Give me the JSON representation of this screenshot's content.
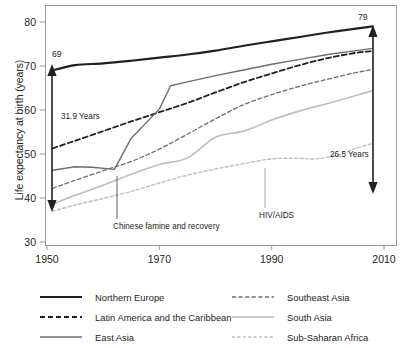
{
  "chart_data": {
    "type": "line",
    "title": "",
    "xlabel": "",
    "ylabel": "Life expectancy at birth (years)",
    "xlim": [
      1950,
      2012
    ],
    "ylim": [
      30,
      82
    ],
    "xticks": [
      1950,
      1970,
      1990,
      2010
    ],
    "yticks": [
      30,
      40,
      50,
      60,
      70,
      80
    ],
    "grid": false,
    "legend_position": "bottom",
    "series": [
      {
        "name": "Northern Europe",
        "style": "solid-thick-black",
        "color": "#231f20",
        "points": [
          [
            1951,
            69.0
          ],
          [
            1955,
            70.2
          ],
          [
            1960,
            70.6
          ],
          [
            1965,
            71.2
          ],
          [
            1970,
            71.9
          ],
          [
            1975,
            72.6
          ],
          [
            1980,
            73.5
          ],
          [
            1985,
            74.6
          ],
          [
            1990,
            75.6
          ],
          [
            1995,
            76.6
          ],
          [
            2000,
            77.6
          ],
          [
            2005,
            78.5
          ],
          [
            2008,
            79.0
          ]
        ]
      },
      {
        "name": "Latin America and the Caribbean",
        "style": "dashed-black",
        "color": "#231f20",
        "points": [
          [
            1951,
            51.3
          ],
          [
            1955,
            53.0
          ],
          [
            1960,
            55.2
          ],
          [
            1965,
            57.4
          ],
          [
            1970,
            59.5
          ],
          [
            1975,
            61.6
          ],
          [
            1980,
            64.0
          ],
          [
            1985,
            66.3
          ],
          [
            1990,
            68.3
          ],
          [
            1995,
            70.2
          ],
          [
            2000,
            71.8
          ],
          [
            2005,
            73.0
          ],
          [
            2008,
            73.4
          ]
        ]
      },
      {
        "name": "East Asia",
        "style": "solid-gray",
        "color": "#6d6e71",
        "points": [
          [
            1951,
            46.3
          ],
          [
            1955,
            47.1
          ],
          [
            1958,
            47.0
          ],
          [
            1962,
            46.5
          ],
          [
            1965,
            53.6
          ],
          [
            1970,
            60.2
          ],
          [
            1972,
            65.5
          ],
          [
            1975,
            66.4
          ],
          [
            1980,
            67.8
          ],
          [
            1985,
            69.1
          ],
          [
            1990,
            70.4
          ],
          [
            1995,
            71.5
          ],
          [
            2000,
            72.6
          ],
          [
            2005,
            73.5
          ],
          [
            2008,
            74.0
          ]
        ]
      },
      {
        "name": "Southeast Asia",
        "style": "dashed-gray",
        "color": "#6d6e71",
        "points": [
          [
            1951,
            42.2
          ],
          [
            1955,
            44.0
          ],
          [
            1960,
            46.2
          ],
          [
            1965,
            48.3
          ],
          [
            1970,
            51.1
          ],
          [
            1975,
            54.5
          ],
          [
            1980,
            58.0
          ],
          [
            1985,
            61.2
          ],
          [
            1990,
            63.5
          ],
          [
            1995,
            65.4
          ],
          [
            2000,
            67.0
          ],
          [
            2005,
            68.5
          ],
          [
            2008,
            69.2
          ]
        ]
      },
      {
        "name": "South Asia",
        "style": "solid-lightgray",
        "color": "#bcbec0",
        "points": [
          [
            1951,
            38.6
          ],
          [
            1955,
            40.6
          ],
          [
            1960,
            42.9
          ],
          [
            1965,
            45.4
          ],
          [
            1970,
            47.6
          ],
          [
            1975,
            49.1
          ],
          [
            1980,
            53.8
          ],
          [
            1985,
            55.2
          ],
          [
            1990,
            57.7
          ],
          [
            1995,
            59.8
          ],
          [
            2000,
            61.5
          ],
          [
            2005,
            63.3
          ],
          [
            2008,
            64.4
          ]
        ]
      },
      {
        "name": "Sub-Saharan Africa",
        "style": "dashed-lightgray",
        "color": "#bcbec0",
        "points": [
          [
            1951,
            37.0
          ],
          [
            1955,
            38.4
          ],
          [
            1960,
            39.9
          ],
          [
            1965,
            41.5
          ],
          [
            1970,
            43.4
          ],
          [
            1975,
            45.2
          ],
          [
            1980,
            46.6
          ],
          [
            1985,
            47.8
          ],
          [
            1990,
            48.9
          ],
          [
            1995,
            49.0
          ],
          [
            1998,
            48.9
          ],
          [
            2002,
            49.8
          ],
          [
            2005,
            51.3
          ],
          [
            2008,
            52.4
          ]
        ]
      }
    ],
    "annotations": [
      {
        "name": "left-value-label",
        "text": "69",
        "x": 1951,
        "y": 69.0
      },
      {
        "name": "right-value-label",
        "text": "79",
        "x": 2008,
        "y": 79.0
      },
      {
        "name": "left-gap-label",
        "text": "31.9 Years"
      },
      {
        "name": "right-gap-label",
        "text": "26.5 Years"
      },
      {
        "name": "famine-annotation",
        "text": "Chinese famine and recovery",
        "x": 1962
      },
      {
        "name": "hivaids-annotation",
        "text": "HIV/AIDS",
        "x": 1989
      }
    ]
  },
  "axes": {
    "y_title": "Life expectancy at birth (years)",
    "y_ticks": [
      "80",
      "70",
      "60",
      "50",
      "40",
      "30"
    ],
    "x_ticks": [
      "1950",
      "1970",
      "1990",
      "2010"
    ]
  },
  "legend": {
    "left_column": [
      {
        "label": "Northern Europe",
        "swatch": "solid-thick-black"
      },
      {
        "label": "Latin America and the Caribbean",
        "swatch": "dashed-black"
      },
      {
        "label": "East Asia",
        "swatch": "solid-gray"
      }
    ],
    "right_column": [
      {
        "label": "Southeast Asia",
        "swatch": "dashed-gray"
      },
      {
        "label": "South Asia",
        "swatch": "solid-lightgray"
      },
      {
        "label": "Sub-Saharan Africa",
        "swatch": "dashed-lightgray"
      }
    ]
  },
  "colors": {
    "black": "#231f20",
    "gray": "#6d6e71",
    "light_gray": "#bcbec0",
    "frame": "#9a9a9a"
  }
}
